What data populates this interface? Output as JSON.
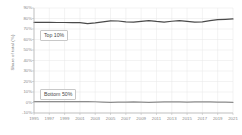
{
  "chart_data": {
    "type": "line",
    "title": "",
    "xlabel": "",
    "ylabel": "Share of total (%)",
    "ylim": [
      -10,
      90
    ],
    "xlim": [
      1995,
      2021
    ],
    "grid": true,
    "legend_position": "inline-annotation",
    "yticks": [
      "90%",
      "80%",
      "70%",
      "60%",
      "50%",
      "40%",
      "30%",
      "20%",
      "10%",
      "0%",
      "-10%"
    ],
    "ytick_values": [
      90,
      80,
      70,
      60,
      50,
      40,
      30,
      20,
      10,
      0,
      -10
    ],
    "xticks": [
      "1995",
      "1997",
      "1999",
      "2001",
      "2003",
      "2005",
      "2007",
      "2009",
      "2011",
      "2013",
      "2015",
      "2017",
      "2019",
      "2021"
    ],
    "xtick_values": [
      1995,
      1997,
      1999,
      2001,
      2003,
      2005,
      2007,
      2009,
      2011,
      2013,
      2015,
      2017,
      2019,
      2021
    ],
    "x": [
      1995,
      1996,
      1997,
      1998,
      1999,
      2000,
      2001,
      2002,
      2003,
      2004,
      2005,
      2006,
      2007,
      2008,
      2009,
      2010,
      2011,
      2012,
      2013,
      2014,
      2015,
      2016,
      2017,
      2018,
      2019,
      2020,
      2021
    ],
    "series": [
      {
        "name": "Top 10%",
        "color": "#4a4a4a",
        "annotation": "Top 10%",
        "values": [
          76.4,
          76.3,
          76.3,
          76.2,
          76.2,
          76.1,
          76.0,
          75.2,
          75.8,
          76.8,
          77.8,
          77.6,
          76.8,
          76.5,
          77.3,
          78.0,
          77.2,
          76.6,
          77.4,
          78.0,
          77.3,
          76.6,
          76.8,
          78.0,
          78.9,
          79.2,
          79.6
        ]
      },
      {
        "name": "Bottom 50%",
        "color": "#8c8c8c",
        "annotation": "Bottom 50%",
        "values": [
          0.8,
          0.8,
          0.9,
          0.9,
          0.9,
          0.8,
          0.8,
          0.9,
          0.7,
          0.4,
          0.2,
          0.3,
          0.4,
          0.5,
          0.3,
          0.2,
          0.3,
          0.5,
          0.6,
          0.5,
          0.4,
          0.5,
          0.6,
          0.5,
          0.4,
          0.3,
          0.2
        ]
      }
    ]
  }
}
